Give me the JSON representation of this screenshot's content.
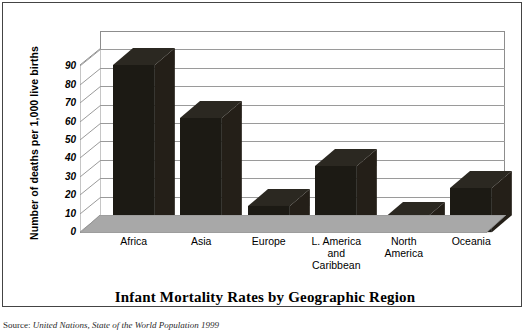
{
  "chart_data": {
    "type": "bar",
    "title": "Infant Mortality Rates by Geographic Region",
    "xlabel": "",
    "ylabel": "Number of deaths per 1,000 live births",
    "categories": [
      "Africa",
      "Asia",
      "Europe",
      "L. America and Caribbean",
      "North America",
      "Oceania"
    ],
    "category_lines": [
      [
        "Africa"
      ],
      [
        "Asia"
      ],
      [
        "Europe"
      ],
      [
        "L. America",
        "and",
        "Caribbean"
      ],
      [
        "North",
        "America"
      ],
      [
        "Oceania"
      ]
    ],
    "values": [
      91,
      62,
      14,
      36,
      7,
      24
    ],
    "ylim": [
      0,
      100
    ],
    "yticks": [
      0,
      10,
      20,
      30,
      40,
      50,
      60,
      70,
      80,
      90
    ],
    "ytick_labels": [
      "0",
      "10",
      "20",
      "30",
      "40",
      "50",
      "60",
      "70",
      "80",
      "90"
    ],
    "grid": true,
    "legend": "none",
    "style": "3d-column",
    "bar_color": "#1c1a14",
    "floor_color": "#a8a8a8",
    "gridline_color": "#9a9a9a"
  },
  "source": {
    "lead": "Source:",
    "text": " United Nations, State of the World Population 1999"
  }
}
